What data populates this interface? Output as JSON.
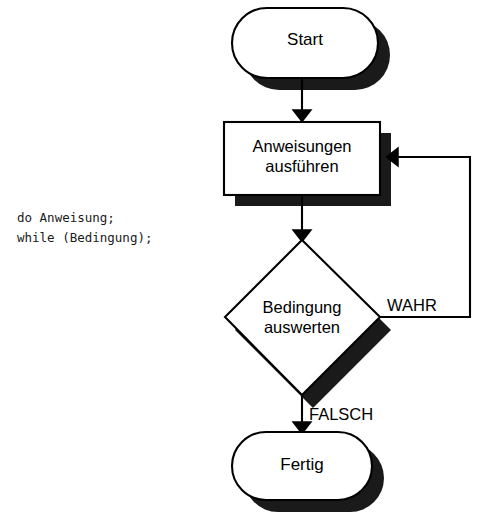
{
  "diagram": {
    "style": {
      "line_color": "#000000",
      "shadow_color": "#1a1a1a",
      "fill_color": "#ffffff",
      "text_color": "#000000"
    },
    "code_snippet": {
      "line1": "do Anweisung;",
      "line2": "while (Bedingung);"
    },
    "nodes": [
      {
        "id": "start",
        "shape": "stadium",
        "label": "Start"
      },
      {
        "id": "process",
        "shape": "rectangle",
        "label_line1": "Anweisungen",
        "label_line2": "ausführen"
      },
      {
        "id": "decision",
        "shape": "diamond",
        "label_line1": "Bedingung",
        "label_line2": "auswerten"
      },
      {
        "id": "end",
        "shape": "stadium",
        "label": "Fertig"
      }
    ],
    "edges": [
      {
        "id": "start-to-process",
        "label": ""
      },
      {
        "id": "process-to-decision",
        "label": ""
      },
      {
        "id": "decision-true-loop",
        "label": "WAHR"
      },
      {
        "id": "decision-false-to-end",
        "label": "FALSCH"
      }
    ]
  }
}
